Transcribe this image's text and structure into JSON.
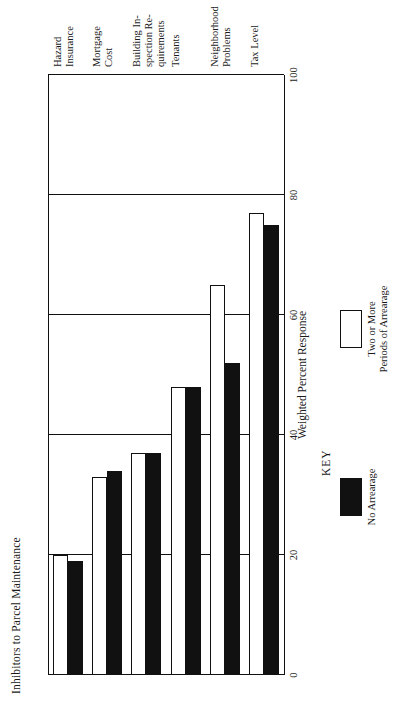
{
  "chart_data": {
    "type": "bar",
    "orientation": "horizontal",
    "title": "Inhibitors to Parcel Maintenance",
    "xlabel": "",
    "ylabel": "Weighted Percent Response",
    "categories": [
      "Tax Level",
      "Neighborhood\nProblems",
      "Tenants",
      "Building In-\nspection Re-\nquirements",
      "Mortgage\nCost",
      "Hazard\nInsurance"
    ],
    "series": [
      {
        "name": "No Arrearage",
        "values": [
          75,
          52,
          48,
          37,
          34,
          19
        ],
        "color": "#111111"
      },
      {
        "name": "Two or More\nPeriods of Arrearage",
        "values": [
          77,
          65,
          48,
          37,
          33,
          20
        ],
        "color": "#ffffff"
      }
    ],
    "ylim": [
      0,
      100
    ],
    "ticks": [
      0,
      20,
      40,
      60,
      80,
      100
    ],
    "tick_labels": [
      "0",
      "20",
      "40",
      "60",
      "80",
      "100"
    ],
    "grid": true,
    "legend_position": "below-axis",
    "legend_title": "KEY"
  },
  "axis": {
    "value_axis_title": "Weighted Percent Response"
  },
  "legend": {
    "title": "KEY",
    "items": [
      {
        "label": "No Arrearage",
        "swatch": "dark"
      },
      {
        "label": "Two or More\nPeriods of Arrearage",
        "swatch": "light"
      }
    ]
  }
}
